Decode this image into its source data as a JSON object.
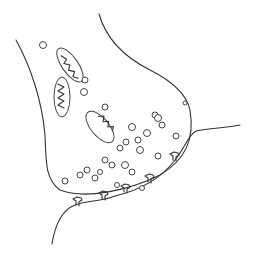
{
  "diagram": {
    "style": "hand-drawn line art",
    "colors": {
      "background": "#ffffff",
      "stroke": "#333333"
    },
    "parts": [
      {
        "name": "presynaptic-terminal"
      },
      {
        "name": "mitochondrion",
        "count": 3
      },
      {
        "name": "synaptic-vesicle"
      },
      {
        "name": "synaptic-cleft"
      },
      {
        "name": "postsynaptic-membrane"
      },
      {
        "name": "receptor",
        "count": 6
      }
    ]
  }
}
